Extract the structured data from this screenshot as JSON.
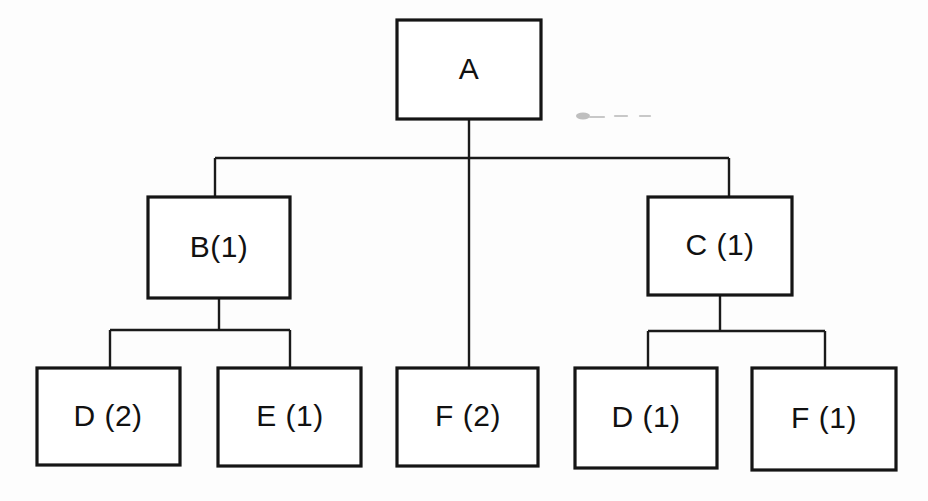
{
  "diagram": {
    "type": "hierarchy-tree",
    "title": "",
    "background_color": "#fdfdfd",
    "line_color": "#1a1a1a",
    "box_fill": "#ffffff",
    "box_stroke": "#151515",
    "nodes": [
      {
        "id": "a",
        "label": "A",
        "x": 397,
        "y": 20,
        "w": 144,
        "h": 99,
        "level": 0
      },
      {
        "id": "b",
        "label": "B(1)",
        "x": 148,
        "y": 197,
        "w": 142,
        "h": 101,
        "level": 1
      },
      {
        "id": "c",
        "label": "C (1)",
        "x": 648,
        "y": 197,
        "w": 144,
        "h": 98,
        "level": 1
      },
      {
        "id": "d2",
        "label": "D (2)",
        "x": 37,
        "y": 368,
        "w": 143,
        "h": 97,
        "level": 2
      },
      {
        "id": "e1",
        "label": "E (1)",
        "x": 218,
        "y": 368,
        "w": 143,
        "h": 98,
        "level": 2
      },
      {
        "id": "f2",
        "label": "F (2)",
        "x": 397,
        "y": 368,
        "w": 141,
        "h": 98,
        "level": 2
      },
      {
        "id": "d1",
        "label": "D (1)",
        "x": 575,
        "y": 368,
        "w": 142,
        "h": 100,
        "level": 2
      },
      {
        "id": "f1",
        "label": "F (1)",
        "x": 752,
        "y": 368,
        "w": 144,
        "h": 102,
        "level": 2
      }
    ],
    "edges": [
      {
        "from": "a",
        "to": "b",
        "name": "edge-a-b"
      },
      {
        "from": "a",
        "to": "c",
        "name": "edge-a-c"
      },
      {
        "from": "a",
        "to": "f2",
        "name": "edge-a-f2"
      },
      {
        "from": "b",
        "to": "d2",
        "name": "edge-b-d2"
      },
      {
        "from": "b",
        "to": "e1",
        "name": "edge-b-e1"
      },
      {
        "from": "c",
        "to": "d1",
        "name": "edge-c-d1"
      },
      {
        "from": "c",
        "to": "f1",
        "name": "edge-c-f1"
      }
    ],
    "artifact": {
      "name": "scan-artifact",
      "visible": true,
      "color": "#a8a8a8"
    }
  }
}
